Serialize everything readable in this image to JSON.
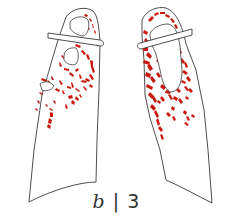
{
  "figure": {
    "type": "lung-illustration",
    "panel_label": {
      "letter": "b",
      "separator": "|",
      "number": "3"
    },
    "colors": {
      "outline": "#3a3a3a",
      "lesion": "#c8180f",
      "background": "#ffffff",
      "cavity_fill": "#ffffff"
    },
    "lungs": [
      {
        "side": "right-lung (viewer left)",
        "lesion_extent": "upper and mid zones, sparse",
        "cavities": 3
      },
      {
        "side": "left-lung (viewer right)",
        "lesion_extent": "upper and mid zones, dense",
        "cavities": 2
      }
    ]
  }
}
